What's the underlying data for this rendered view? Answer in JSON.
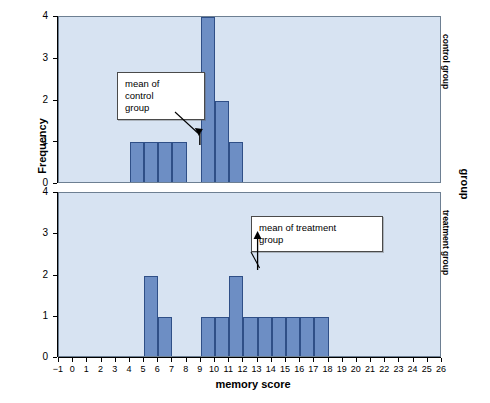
{
  "chart_data": {
    "type": "bar",
    "title": "",
    "xlabel": "memory score",
    "ylabel": "Frequency",
    "right_axis_label": "group",
    "xlim": [
      -1,
      26
    ],
    "ylim": [
      0,
      4
    ],
    "xticks": [
      "−1",
      "0",
      "1",
      "2",
      "3",
      "4",
      "5",
      "6",
      "7",
      "8",
      "9",
      "10",
      "11",
      "12",
      "13",
      "14",
      "15",
      "16",
      "17",
      "18",
      "19",
      "20",
      "21",
      "22",
      "23",
      "24",
      "25",
      "26"
    ],
    "yticks": [
      "0",
      "1",
      "2",
      "3",
      "4"
    ],
    "grid": false,
    "legend": "none",
    "panels": [
      {
        "name": "control group",
        "label": "control group",
        "bins": [
          {
            "start": 4,
            "end": 5,
            "frequency": 1
          },
          {
            "start": 5,
            "end": 6,
            "frequency": 1
          },
          {
            "start": 6,
            "end": 7,
            "frequency": 1
          },
          {
            "start": 7,
            "end": 8,
            "frequency": 1
          },
          {
            "start": 9,
            "end": 10,
            "frequency": 4
          },
          {
            "start": 10,
            "end": 11,
            "frequency": 2
          },
          {
            "start": 11,
            "end": 12,
            "frequency": 1
          }
        ],
        "annotation": {
          "text": "mean of control group",
          "lines": [
            "mean of",
            "control",
            "group"
          ],
          "points_to_x": 9.0
        }
      },
      {
        "name": "treatment group",
        "label": "treatment group",
        "bins": [
          {
            "start": 5,
            "end": 6,
            "frequency": 2
          },
          {
            "start": 6,
            "end": 7,
            "frequency": 1
          },
          {
            "start": 9,
            "end": 10,
            "frequency": 1
          },
          {
            "start": 10,
            "end": 11,
            "frequency": 1
          },
          {
            "start": 11,
            "end": 12,
            "frequency": 2
          },
          {
            "start": 12,
            "end": 13,
            "frequency": 1
          },
          {
            "start": 13,
            "end": 14,
            "frequency": 1
          },
          {
            "start": 14,
            "end": 15,
            "frequency": 1
          },
          {
            "start": 15,
            "end": 16,
            "frequency": 1
          },
          {
            "start": 16,
            "end": 17,
            "frequency": 1
          },
          {
            "start": 17,
            "end": 18,
            "frequency": 1
          }
        ],
        "annotation": {
          "text": "mean of treatment group",
          "lines": [
            "mean of treatment",
            "group"
          ],
          "points_to_x": 13.0
        }
      }
    ],
    "colors": {
      "bar_fill": "#6d8ec4",
      "bar_border": "#2f4f87",
      "panel_background": "#d7e3f2",
      "panel_border": "#6d7f92",
      "callout_background": "#ffffff",
      "callout_border": "#4a4a4a",
      "text": "#000000"
    }
  }
}
